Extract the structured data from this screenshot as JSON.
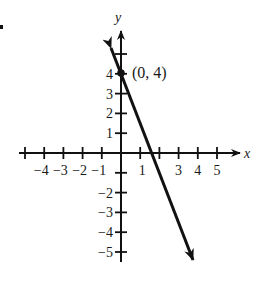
{
  "chart_data": {
    "type": "line",
    "title": "",
    "xlabel": "x",
    "ylabel": "y",
    "xlim": [
      -5,
      5.5
    ],
    "ylim": [
      -5.5,
      5.5
    ],
    "grid": false,
    "legend": null,
    "x_ticks": [
      -5,
      -4,
      -3,
      -2,
      -1,
      1,
      2,
      3,
      4,
      5
    ],
    "x_tick_labels": [
      {
        "value": -4,
        "text": "−4"
      },
      {
        "value": -3,
        "text": "−3"
      },
      {
        "value": -2,
        "text": "−2"
      },
      {
        "value": -1,
        "text": "−1"
      },
      {
        "value": 1,
        "text": "1"
      },
      {
        "value": 3,
        "text": "3"
      },
      {
        "value": 4,
        "text": "4"
      },
      {
        "value": 5,
        "text": "5"
      }
    ],
    "y_ticks": [
      -5,
      -4,
      -3,
      -2,
      -1,
      1,
      2,
      3,
      4,
      5
    ],
    "y_tick_labels": [
      {
        "value": 4,
        "text": "4"
      },
      {
        "value": 3,
        "text": "3"
      },
      {
        "value": 2,
        "text": "2"
      },
      {
        "value": 1,
        "text": "1"
      },
      {
        "value": -2,
        "text": "−2"
      },
      {
        "value": -3,
        "text": "−3"
      },
      {
        "value": -4,
        "text": "−4"
      },
      {
        "value": -5,
        "text": "−5"
      }
    ],
    "series": [
      {
        "name": "line",
        "equation": "y = -2.5x + 4",
        "x": [
          -0.52,
          0,
          1.6,
          3.75
        ],
        "y": [
          5.3,
          4,
          0,
          -5.4
        ],
        "arrows": "both"
      }
    ],
    "points": [
      {
        "x": 0,
        "y": 4,
        "label": "(0, 4)"
      }
    ],
    "annotations": [
      "(0, 4)"
    ]
  },
  "labels": {
    "x_axis": "x",
    "y_axis": "y",
    "point": "(0, 4)"
  },
  "colors": {
    "ink": "#111111",
    "background": "#ffffff"
  }
}
